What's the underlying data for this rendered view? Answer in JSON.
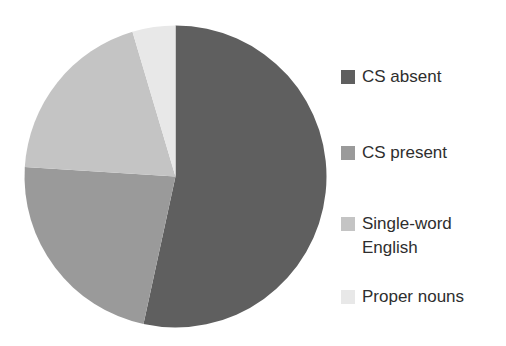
{
  "chart_data": {
    "type": "pie",
    "title": "",
    "start_angle_deg": 0,
    "direction": "clockwise",
    "categories": [
      "CS absent",
      "CS present",
      "Single-word English",
      "Proper nouns"
    ],
    "values": [
      53.4,
      22.6,
      19.4,
      4.6
    ],
    "unit": "%",
    "colors": [
      "#5f5f5f",
      "#9a9a9a",
      "#c4c4c4",
      "#e8e8e8"
    ],
    "legend_position": "right",
    "data_labels": false
  },
  "legend": {
    "items": [
      {
        "label": "CS absent",
        "color": "#5f5f5f"
      },
      {
        "label": "CS present",
        "color": "#9a9a9a"
      },
      {
        "label": "Single-word\nEnglish",
        "color": "#c4c4c4"
      },
      {
        "label": "Proper nouns",
        "color": "#e8e8e8"
      }
    ]
  },
  "pie": {
    "cx": 175.5,
    "cy": 176.5,
    "r": 151
  }
}
